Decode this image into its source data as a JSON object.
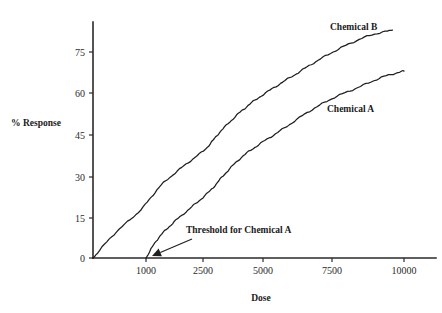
{
  "chart_data": {
    "type": "line",
    "title": "",
    "xlabel": "Dose",
    "ylabel": "% Response",
    "xlim": [
      0,
      10000
    ],
    "ylim": [
      0,
      90
    ],
    "grid": false,
    "legend_position": "inline-labels",
    "x_ticks": [
      "1000",
      "2500",
      "5000",
      "7500",
      "10000"
    ],
    "x_tick_values": [
      1000,
      2500,
      5000,
      7500,
      10000
    ],
    "x_tick_px": [
      146,
      203,
      263,
      332,
      404
    ],
    "y_ticks": [
      "0",
      "15",
      "30",
      "45",
      "60",
      "75"
    ],
    "y_tick_values": [
      0,
      15,
      30,
      45,
      60,
      75
    ],
    "y_tick_px": [
      258,
      218,
      177,
      135,
      93,
      52
    ],
    "series": [
      {
        "name": "Chemical B",
        "label": "Chemical B",
        "label_px": {
          "x": 330,
          "y": 30
        },
        "x": [
          0,
          400,
          900,
          1400,
          2000,
          2600,
          3200,
          3900,
          4600,
          5400,
          6200,
          7000,
          7900,
          8800,
          9600
        ],
        "values": [
          0,
          9,
          18,
          27,
          34,
          40,
          46,
          52,
          57,
          62,
          67,
          72,
          77,
          81,
          83
        ]
      },
      {
        "name": "Chemical A",
        "label": "Chemical A",
        "label_px": {
          "x": 327,
          "y": 112
        },
        "x": [
          1000,
          1300,
          1700,
          2200,
          2800,
          3400,
          4100,
          4900,
          5700,
          6600,
          7500,
          8400,
          9300,
          10000
        ],
        "values": [
          0,
          7,
          13,
          19,
          25,
          31,
          37,
          42,
          47,
          53,
          58,
          62,
          66,
          68
        ]
      }
    ],
    "annotations": [
      {
        "text": "Threshold for Chemical A",
        "text_px": {
          "x": 186,
          "y": 233
        },
        "arrow_from_px": {
          "x": 192,
          "y": 239
        },
        "arrow_to_px": {
          "x": 152,
          "y": 256
        },
        "target_dose": 1000
      }
    ],
    "colors": {
      "axis": "#2a2a2a",
      "curve": "#1f1f1f",
      "text": "#1a1a1a",
      "background": "#ffffff"
    }
  }
}
